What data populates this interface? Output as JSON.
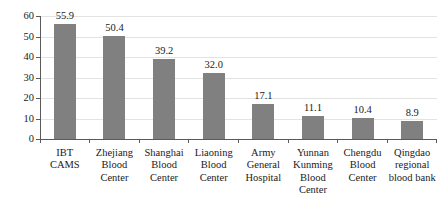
{
  "chart_data": {
    "type": "bar",
    "title": "",
    "subtitle": "",
    "xlabel": "",
    "ylabel": "",
    "ylim": [
      0,
      60
    ],
    "yticks": [
      0,
      10,
      20,
      30,
      40,
      50,
      60
    ],
    "ytick_labels": [
      "0",
      "10",
      "20",
      "30",
      "40",
      "50",
      "60"
    ],
    "grid": true,
    "grid_axis": "y",
    "legend": false,
    "legend_position": "none",
    "bar_color": "#808080",
    "axis_color": "#5a5a5a",
    "gridline_color": "#e3e3e3",
    "value_label_format": "one-decimal",
    "categories": [
      "IBT CAMS",
      "Zhejiang Blood Center",
      "Shanghai Blood Center",
      "Liaoning Blood Center",
      "Army General Hospital",
      "Yunnan Kunming Blood Center",
      "Chengdu Blood Center",
      "Qingdao regional blood bank"
    ],
    "category_label_lines": [
      [
        "IBT",
        "CAMS"
      ],
      [
        "Zhejiang",
        "Blood",
        "Center"
      ],
      [
        "Shanghai",
        "Blood",
        "Center"
      ],
      [
        "Liaoning",
        "Blood",
        "Center"
      ],
      [
        "Army",
        "General",
        "Hospital"
      ],
      [
        "Yunnan",
        "Kunming",
        "Blood",
        "Center"
      ],
      [
        "Chengdu",
        "Blood",
        "Center"
      ],
      [
        "Qingdao",
        "regional",
        "blood bank"
      ]
    ],
    "values": [
      55.9,
      50.4,
      39.2,
      32.0,
      17.1,
      11.1,
      10.4,
      8.9
    ],
    "value_labels": [
      "55.9",
      "50.4",
      "39.2",
      "32.0",
      "17.1",
      "11.1",
      "10.4",
      "8.9"
    ]
  }
}
